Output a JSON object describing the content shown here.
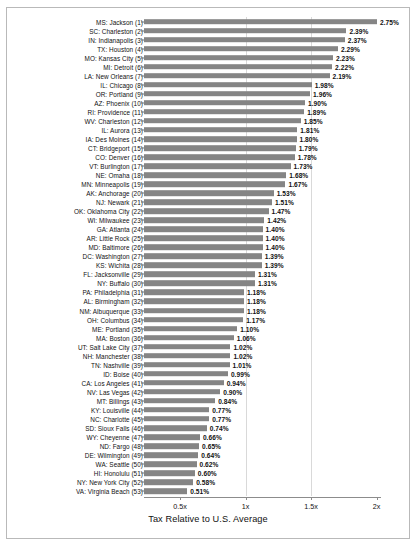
{
  "chart_data": {
    "type": "bar",
    "orientation": "horizontal",
    "title": "",
    "xlabel": "Tax Relative to U.S. Average",
    "ylabel": "",
    "xlim": [
      0,
      2.2
    ],
    "xticks": [
      "0.5x",
      "1x",
      "1.5x",
      "2x"
    ],
    "xtick_values": [
      0.5,
      1,
      1.5,
      2
    ],
    "grid": true,
    "legend": false,
    "bar_color": "#858585",
    "value_suffix": "%",
    "note": "Bar length encodes tax relative to U.S. average; data labels show effective tax percent.",
    "categories": [
      "MS: Jackson (1)",
      "SC: Charleston (2)",
      "IN: Indianapolis (3)",
      "TX: Houston (4)",
      "MO: Kansas City (5)",
      "MI: Detroit (6)",
      "LA: New Orleans (7)",
      "IL: Chicago (8)",
      "OR: Portland (9)",
      "AZ: Phoenix (10)",
      "RI: Providence (11)",
      "WV: Charleston (12)",
      "IL: Aurora (13)",
      "IA: Des Moines (14)",
      "CT: Bridgeport (15)",
      "CO: Denver (16)",
      "VT: Burlington (17)",
      "NE: Omaha (18)",
      "MN: Minneapolis (19)",
      "AK: Anchorage (20)",
      "NJ: Newark (21)",
      "OK: Oklahoma City (22)",
      "WI: Milwaukee (23)",
      "GA: Atlanta (24)",
      "AR: Little Rock (25)",
      "MD: Baltimore (26)",
      "DC: Washington (27)",
      "KS: Wichita (28)",
      "FL: Jacksonville (29)",
      "NY: Buffalo (30)",
      "PA: Philadelphia (31)",
      "AL: Birmingham (32)",
      "NM: Albuquerque (33)",
      "OH: Columbus (34)",
      "ME: Portland (35)",
      "MA: Boston (36)",
      "UT: Salt Lake City (37)",
      "NH: Manchester (38)",
      "TN: Nashville (39)",
      "ID: Boise (40)",
      "CA: Los Angeles (41)",
      "NV: Las Vegas (42)",
      "MT: Billings (43)",
      "KY: Louisville (44)",
      "NC: Charlotte (45)",
      "SD: Sioux Falls (46)",
      "WY: Cheyenne (47)",
      "ND: Fargo (48)",
      "DE: Wilmington (49)",
      "WA: Seattle (50)",
      "HI: Honolulu (51)",
      "NY: New York City (52)",
      "VA: Virginia Beach (53)"
    ],
    "values": [
      2.75,
      2.39,
      2.37,
      2.29,
      2.23,
      2.22,
      2.19,
      1.98,
      1.96,
      1.9,
      1.89,
      1.85,
      1.81,
      1.8,
      1.79,
      1.78,
      1.73,
      1.68,
      1.67,
      1.53,
      1.51,
      1.47,
      1.42,
      1.4,
      1.4,
      1.4,
      1.39,
      1.39,
      1.31,
      1.31,
      1.18,
      1.18,
      1.18,
      1.17,
      1.1,
      1.06,
      1.02,
      1.02,
      1.01,
      0.99,
      0.94,
      0.9,
      0.84,
      0.77,
      0.77,
      0.74,
      0.66,
      0.65,
      0.64,
      0.62,
      0.6,
      0.58,
      0.51
    ],
    "value_labels": [
      "2.75%",
      "2.39%",
      "2.37%",
      "2.29%",
      "2.23%",
      "2.22%",
      "2.19%",
      "1.98%",
      "1.96%",
      "1.90%",
      "1.89%",
      "1.85%",
      "1.81%",
      "1.80%",
      "1.79%",
      "1.78%",
      "1.73%",
      "1.68%",
      "1.67%",
      "1.53%",
      "1.51%",
      "1.47%",
      "1.42%",
      "1.40%",
      "1.40%",
      "1.40%",
      "1.39%",
      "1.39%",
      "1.31%",
      "1.31%",
      "1.18%",
      "1.18%",
      "1.18%",
      "1.17%",
      "1.10%",
      "1.06%",
      "1.02%",
      "1.02%",
      "1.01%",
      "0.99%",
      "0.94%",
      "0.90%",
      "0.84%",
      "0.77%",
      "0.77%",
      "0.74%",
      "0.66%",
      "0.65%",
      "0.64%",
      "0.62%",
      "0.60%",
      "0.58%",
      "0.51%"
    ]
  }
}
